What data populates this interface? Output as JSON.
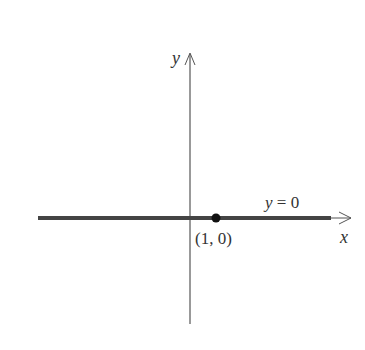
{
  "diagram": {
    "axes": {
      "x_label": "x",
      "y_label": "y"
    },
    "line": {
      "equation": "y = 0",
      "equation_parts": {
        "var": "y",
        "rest": " = 0"
      }
    },
    "point": {
      "label": "(1, 0)",
      "x": 1,
      "y": 0
    },
    "colors": {
      "axis": "#555555",
      "line": "#444444",
      "point": "#111111",
      "text": "#333333"
    }
  }
}
